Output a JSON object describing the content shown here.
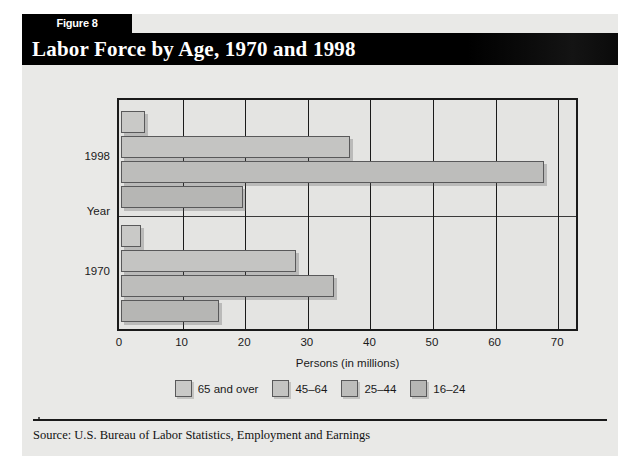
{
  "figure": {
    "tab_label": "Figure 8",
    "title": "Labor Force by Age, 1970 and 1998",
    "source": "Source: U.S. Bureau of Labor Statistics, Employment and Earnings"
  },
  "chart_data": {
    "type": "bar",
    "orientation": "horizontal",
    "title": "Labor Force by Age, 1970 and 1998",
    "xlabel": "Persons (in millions)",
    "ylabel": "Year",
    "xlim": [
      0,
      73
    ],
    "xticks": [
      0,
      10,
      20,
      30,
      40,
      50,
      60,
      70
    ],
    "xtick_labels": [
      "0",
      "10",
      "20",
      "30",
      "40",
      "50",
      "60",
      "70"
    ],
    "categories": [
      "1998",
      "1970"
    ],
    "grid": true,
    "legend_position": "bottom",
    "series": [
      {
        "name": "65 and over",
        "color": "#c9c9c7",
        "values": [
          3.9,
          3.2
        ]
      },
      {
        "name": "45–64",
        "color": "#c4c4c2",
        "values": [
          36.5,
          28.0
        ]
      },
      {
        "name": "25–44",
        "color": "#bdbdbb",
        "values": [
          67.5,
          34.0
        ]
      },
      {
        "name": "16–24",
        "color": "#b6b6b4",
        "values": [
          19.5,
          15.6
        ]
      }
    ]
  },
  "colors": {
    "page_background": "#e9e9e7",
    "plot_background": "#e4e4e2",
    "axis": "#1a1a1a",
    "title_bar": "#000000",
    "title_text": "#ffffff"
  }
}
